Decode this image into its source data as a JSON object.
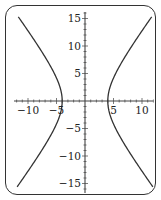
{
  "chart_data": {
    "type": "line",
    "title": "",
    "xlabel": "",
    "ylabel": "",
    "xlim": [
      -12,
      12
    ],
    "ylim": [
      -16,
      16
    ],
    "x_ticks": [
      -10,
      -5,
      5,
      10
    ],
    "y_ticks": [
      15,
      10,
      5,
      -5,
      -10,
      -15
    ],
    "x_tick_labels": [
      "−10",
      "−5",
      "5",
      "10"
    ],
    "y_tick_labels": [
      "15",
      "10",
      "5",
      "−5",
      "−10",
      "−15"
    ],
    "grid": false,
    "legend": null,
    "series": [
      {
        "name": "hyperbola (right branch)",
        "equation": "x^2/16 - y^2/31 = 1",
        "points": [
          [
            11.6,
            -15.5
          ],
          [
            9.5,
            -12
          ],
          [
            7.3,
            -8
          ],
          [
            5.6,
            -5
          ],
          [
            4.6,
            -3
          ],
          [
            4.2,
            -1.5
          ],
          [
            4,
            0
          ],
          [
            4.2,
            1.5
          ],
          [
            4.6,
            3
          ],
          [
            5.6,
            5
          ],
          [
            7.3,
            8
          ],
          [
            9.5,
            12
          ],
          [
            11.6,
            15.5
          ]
        ]
      },
      {
        "name": "hyperbola (left branch)",
        "equation": "x^2/16 - y^2/31 = 1",
        "points": [
          [
            -11.6,
            -15.5
          ],
          [
            -9.5,
            -12
          ],
          [
            -7.3,
            -8
          ],
          [
            -5.6,
            -5
          ],
          [
            -4.6,
            -3
          ],
          [
            -4.2,
            -1.5
          ],
          [
            -4,
            0
          ],
          [
            -4.2,
            1.5
          ],
          [
            -4.6,
            3
          ],
          [
            -5.6,
            5
          ],
          [
            -7.3,
            8
          ],
          [
            -9.5,
            12
          ],
          [
            -11.6,
            15.5
          ]
        ]
      }
    ],
    "colors": {
      "curve": "#333333",
      "axes": "#444444",
      "frame": "#333333"
    }
  }
}
